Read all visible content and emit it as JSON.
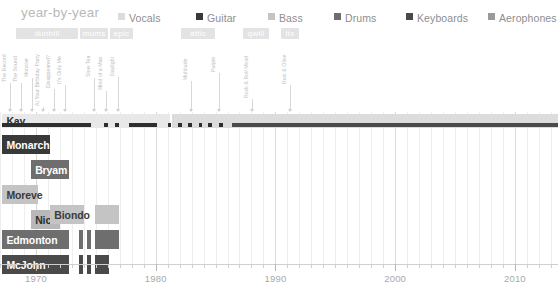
{
  "header": {
    "title": "year-by-year",
    "legend": [
      {
        "label": "Vocals",
        "color": "#dcdcdc",
        "x": 118
      },
      {
        "label": "Guitar",
        "color": "#393939",
        "x": 196
      },
      {
        "label": "Bass",
        "color": "#c4c4c4",
        "x": 268
      },
      {
        "label": "Drums",
        "color": "#6e6e6e",
        "x": 334
      },
      {
        "label": "Keyboards",
        "color": "#4a4a4a",
        "x": 406
      },
      {
        "label": "Aerophones",
        "color": "#9a9a9a",
        "x": 488
      }
    ]
  },
  "record_labels": [
    {
      "name": "dunhill",
      "x": 16,
      "width": 62
    },
    {
      "name": "mums",
      "x": 80,
      "width": 28
    },
    {
      "name": "epic",
      "x": 110,
      "width": 23
    },
    {
      "name": "attic",
      "x": 181,
      "width": 34
    },
    {
      "name": "qwill",
      "x": 243,
      "width": 26
    },
    {
      "name": "ltx",
      "x": 281,
      "width": 18
    }
  ],
  "albums": [
    {
      "title": "The Record",
      "x": 9,
      "lead_top": 44,
      "lead_bottom": 112,
      "text_h": 38
    },
    {
      "title": "The Sound",
      "x": 20,
      "lead_top": 44,
      "lead_bottom": 112,
      "text_h": 38
    },
    {
      "title": "Monster",
      "x": 31,
      "lead_top": 44,
      "lead_bottom": 112,
      "text_h": 33
    },
    {
      "title": "At Your Birthday Party",
      "x": 42,
      "lead_top": 44,
      "lead_bottom": 112,
      "text_h": 62
    },
    {
      "title": "Disappeared?",
      "x": 53,
      "lead_top": 44,
      "lead_bottom": 112,
      "text_h": 44
    },
    {
      "title": "It's Only Me",
      "x": 64,
      "lead_top": 44,
      "lead_bottom": 112,
      "text_h": 40
    },
    {
      "title": "Slow Tea",
      "x": 93,
      "lead_top": 44,
      "lead_bottom": 112,
      "text_h": 33
    },
    {
      "title": "Mind of a Man",
      "x": 105,
      "lead_top": 44,
      "lead_bottom": 112,
      "text_h": 46
    },
    {
      "title": "Daylight",
      "x": 117,
      "lead_top": 44,
      "lead_bottom": 112,
      "text_h": 32
    },
    {
      "title": "Multitude",
      "x": 190,
      "lead_top": 44,
      "lead_bottom": 112,
      "text_h": 36
    },
    {
      "title": "Purple",
      "x": 218,
      "lead_top": 44,
      "lead_bottom": 112,
      "text_h": 28
    },
    {
      "title": "Rock & Roll Motel",
      "x": 251,
      "lead_top": 44,
      "lead_bottom": 112,
      "text_h": 54
    },
    {
      "title": "Rust & Olive",
      "x": 289,
      "lead_top": 44,
      "lead_bottom": 112,
      "text_h": 40
    }
  ],
  "chart_data": {
    "type": "bar",
    "title": "year-by-year",
    "xlabel": "",
    "ylabel": "",
    "xlim": [
      1967.0,
      2013.6
    ],
    "grid": true,
    "legend_position": "top",
    "x_ticks_major": [
      1970,
      1980,
      1990,
      2000,
      2010
    ],
    "x_tick_labels": [
      "1970",
      "1980",
      "1990",
      "2000",
      "2010"
    ],
    "x_tick_step_minor": 1,
    "instruments": {
      "Vocals": "#dcdcdc",
      "Guitar": "#393939",
      "Bass": "#c4c4c4",
      "Drums": "#6e6e6e",
      "Keyboards": "#4a4a4a",
      "Aerophones": "#9a9a9a"
    },
    "rows": [
      {
        "name": "Kay",
        "instrument": "Vocals",
        "label_color": "#2e2e2e",
        "top": 2,
        "height": 14,
        "segments": [
          {
            "start": 1967.2,
            "end": 1981.2,
            "instrument": "Vocals",
            "color": "#e8e8e8"
          },
          {
            "start": 1981.4,
            "end": 2013.6,
            "instrument": "Vocals",
            "color": "#dcdcdc"
          }
        ],
        "overlay": [
          {
            "start": 1967.2,
            "end": 1974.6,
            "color": "#2e2e2e",
            "top": 9,
            "height": 4
          },
          {
            "start": 1975.7,
            "end": 1976.0,
            "color": "#2e2e2e",
            "top": 9,
            "height": 4
          },
          {
            "start": 1976.6,
            "end": 1976.9,
            "color": "#2e2e2e",
            "top": 9,
            "height": 4
          },
          {
            "start": 1977.8,
            "end": 1980.1,
            "color": "#2e2e2e",
            "top": 9,
            "height": 4
          },
          {
            "start": 1981.0,
            "end": 1981.3,
            "color": "#2e2e2e",
            "top": 9,
            "height": 4
          },
          {
            "start": 1981.9,
            "end": 1982.2,
            "color": "#2e2e2e",
            "top": 9,
            "height": 4
          },
          {
            "start": 1982.7,
            "end": 1983.0,
            "color": "#2e2e2e",
            "top": 9,
            "height": 4
          },
          {
            "start": 1983.6,
            "end": 1983.9,
            "color": "#2e2e2e",
            "top": 9,
            "height": 4
          },
          {
            "start": 1984.4,
            "end": 1984.7,
            "color": "#2e2e2e",
            "top": 9,
            "height": 4
          },
          {
            "start": 1985.3,
            "end": 1985.6,
            "color": "#2e2e2e",
            "top": 9,
            "height": 4
          },
          {
            "start": 1986.4,
            "end": 2013.6,
            "color": "#4a4a4a",
            "top": 9,
            "height": 4
          }
        ]
      },
      {
        "name": "Monarch",
        "instrument": "Guitar",
        "label_color": "#ffffff",
        "top": 23,
        "height": 19,
        "segments": [
          {
            "start": 1967.2,
            "end": 1971.2,
            "instrument": "Guitar",
            "color": "#393939"
          }
        ],
        "overlay": []
      },
      {
        "name": "Bryam",
        "instrument": "Drums",
        "label_color": "#ffffff",
        "top": 48,
        "height": 19,
        "segments": [
          {
            "start": 1969.6,
            "end": 1972.8,
            "instrument": "Drums",
            "color": "#6e6e6e"
          }
        ],
        "overlay": []
      },
      {
        "name": "Moreve",
        "instrument": "Bass",
        "label_color": "#3a3a3a",
        "top": 73,
        "height": 19,
        "segments": [
          {
            "start": 1967.2,
            "end": 1970.2,
            "instrument": "Bass",
            "color": "#c4c4c4"
          }
        ],
        "overlay": []
      },
      {
        "name": "Nicholas",
        "instrument": "Aerophones",
        "label_color": "#2e2e2e",
        "top": 98,
        "height": 19,
        "segments": [
          {
            "start": 1969.6,
            "end": 1972.0,
            "instrument": "Aerophones",
            "color": "#b8b8b8"
          }
        ],
        "overlay": []
      },
      {
        "name": "Biondo",
        "instrument": "Bass",
        "label_color": "#3a3a3a",
        "top": 93,
        "height": 19,
        "segments": [
          {
            "start": 1971.2,
            "end": 1974.0,
            "instrument": "Bass",
            "color": "#c4c4c4"
          },
          {
            "start": 1974.9,
            "end": 1976.9,
            "instrument": "Bass",
            "color": "#c4c4c4"
          }
        ],
        "overlay": []
      },
      {
        "name": "Edmonton",
        "instrument": "Drums",
        "label_color": "#ffffff",
        "top": 118,
        "height": 19,
        "segments": [
          {
            "start": 1967.2,
            "end": 1972.8,
            "instrument": "Drums",
            "color": "#6e6e6e"
          },
          {
            "start": 1973.6,
            "end": 1973.9,
            "instrument": "Drums",
            "color": "#6e6e6e"
          },
          {
            "start": 1974.3,
            "end": 1974.6,
            "instrument": "Drums",
            "color": "#6e6e6e"
          },
          {
            "start": 1974.9,
            "end": 1976.9,
            "instrument": "Drums",
            "color": "#6e6e6e"
          }
        ],
        "overlay": []
      },
      {
        "name": "McJohn",
        "instrument": "Keyboards",
        "label_color": "#ffffff",
        "top": 143,
        "height": 19,
        "segments": [
          {
            "start": 1967.2,
            "end": 1972.8,
            "instrument": "Keyboards",
            "color": "#4a4a4a"
          },
          {
            "start": 1973.6,
            "end": 1973.9,
            "instrument": "Keyboards",
            "color": "#4a4a4a"
          },
          {
            "start": 1974.3,
            "end": 1974.6,
            "instrument": "Keyboards",
            "color": "#4a4a4a"
          },
          {
            "start": 1974.9,
            "end": 1976.1,
            "instrument": "Keyboards",
            "color": "#4a4a4a"
          }
        ],
        "overlay": []
      }
    ]
  }
}
